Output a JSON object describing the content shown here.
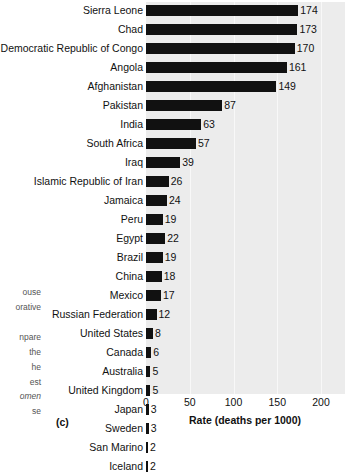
{
  "chart_data": {
    "type": "bar",
    "orientation": "horizontal",
    "title": "",
    "xlabel": "Rate (deaths per 1000)",
    "ylabel": "",
    "xlim": [
      0,
      225
    ],
    "xticks": [
      0,
      50,
      100,
      150,
      200
    ],
    "grid": true,
    "legend": "none",
    "panel_label": "(c)",
    "categories": [
      "Sierra Leone",
      "Chad",
      "Democratic Republic of Congo",
      "Angola",
      "Afghanistan",
      "Pakistan",
      "India",
      "South Africa",
      "Iraq",
      "Islamic Republic of Iran",
      "Jamaica",
      "Peru",
      "Egypt",
      "Brazil",
      "China",
      "Mexico",
      "Russian Federation",
      "United States",
      "Canada",
      "Australia",
      "United Kingdom",
      "Japan",
      "Sweden",
      "San Marino",
      "Iceland"
    ],
    "values": [
      174,
      173,
      170,
      161,
      149,
      87,
      63,
      57,
      39,
      26,
      24,
      19,
      22,
      19,
      18,
      17,
      12,
      8,
      6,
      5,
      5,
      3,
      3,
      2,
      2
    ],
    "bar_color": "#111111",
    "plot_background": "#ececec"
  },
  "caption_fragments": [
    {
      "text": "ouse",
      "top": 288,
      "italic": false
    },
    {
      "text": "orative",
      "top": 303,
      "italic": false
    },
    {
      "text": "npare",
      "top": 333,
      "italic": false
    },
    {
      "text": "the",
      "top": 348,
      "italic": false
    },
    {
      "text": "he",
      "top": 363,
      "italic": false
    },
    {
      "text": "est",
      "top": 378,
      "italic": false
    },
    {
      "text": "omen",
      "top": 392,
      "italic": true
    },
    {
      "text": "se",
      "top": 407,
      "italic": false
    }
  ]
}
